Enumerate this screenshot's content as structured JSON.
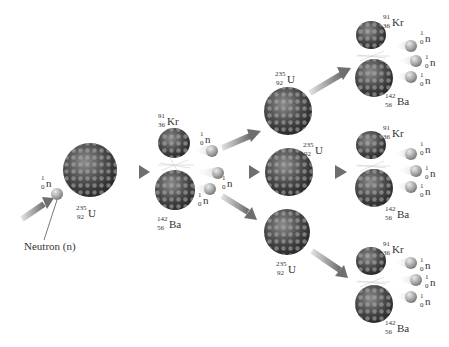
{
  "labels": {
    "neutron_caption": "Neutron (n)"
  },
  "isotopes": {
    "neutron": {
      "mass": "1",
      "atomic": "0",
      "symbol": "n"
    },
    "uranium": {
      "mass": "235",
      "atomic": "92",
      "symbol": "U"
    },
    "krypton": {
      "mass": "91",
      "atomic": "36",
      "symbol": "Kr"
    },
    "barium": {
      "mass": "142",
      "atomic": "56",
      "symbol": "Ba"
    }
  },
  "colors": {
    "nucleus_dark": "#3a3a3a",
    "nucleus_light": "#9a9a9a",
    "neutron": "#a8a8a8",
    "arrow": "#8a8a8a",
    "background": "#ffffff"
  },
  "stages": [
    {
      "name": "initial",
      "nuclei": [
        "U-235"
      ],
      "incoming": "n"
    },
    {
      "name": "first-fission",
      "products": [
        "Kr-91",
        "Ba-142"
      ],
      "neutrons_released": 3
    },
    {
      "name": "second-generation",
      "nuclei": [
        "U-235",
        "U-235",
        "U-235"
      ]
    },
    {
      "name": "second-fission",
      "products_each": [
        "Kr-91",
        "Ba-142"
      ],
      "neutrons_released_each": 3,
      "count": 3
    }
  ]
}
